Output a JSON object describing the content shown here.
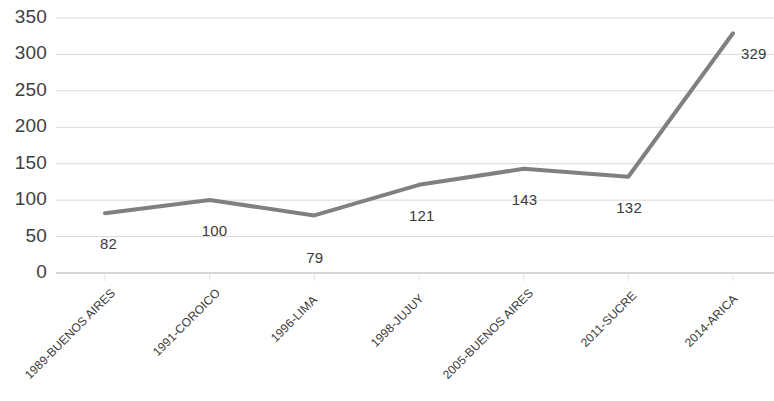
{
  "chart_data": {
    "type": "line",
    "title": "",
    "subtitle": "",
    "xlabel": "",
    "ylabel": "",
    "categories": [
      "1989-BUENOS AIRES",
      "1991-COROICO",
      "1996-LIMA",
      "1998-JUJUY",
      "2005-BUENOS AIRES",
      "2011-SUCRE",
      "2014-ARICA"
    ],
    "values": [
      82,
      100,
      79,
      121,
      143,
      132,
      329
    ],
    "data_labels": [
      "82",
      "100",
      "79",
      "121",
      "143",
      "132",
      "329"
    ],
    "ylim": [
      0,
      350
    ],
    "ytick_values": [
      0,
      50,
      100,
      150,
      200,
      250,
      300,
      350
    ],
    "ytick_labels": [
      "0",
      "50",
      "100",
      "150",
      "200",
      "250",
      "300",
      "350"
    ],
    "grid": true,
    "grid_axis": "y",
    "legend": false,
    "legend_position": "none",
    "series_color": "#808080",
    "gridline_color": "#d9d9d9",
    "axis_color": "#bfbfbf",
    "line_width": 4,
    "markers": false,
    "xtick_rotation": -45
  },
  "colors": {
    "background": "#ffffff",
    "line": "#808080",
    "grid": "#d9d9d9",
    "axis": "#bfbfbf",
    "text": "#3f3f3f"
  }
}
